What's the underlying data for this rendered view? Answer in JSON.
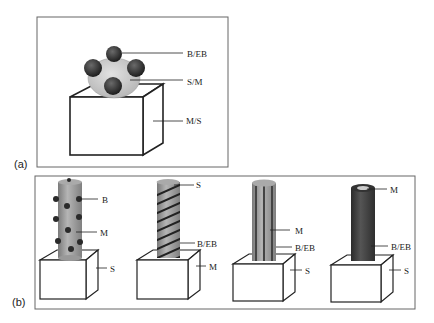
{
  "panel_a": {
    "label": "(a)",
    "callouts": {
      "top": "B/EB",
      "middle": "S/M",
      "bottom": "M/S"
    }
  },
  "panel_b": {
    "label": "(b)",
    "structures": [
      {
        "callouts": [
          "B",
          "M",
          "S"
        ]
      },
      {
        "callouts": [
          "S",
          "B/EB",
          "M"
        ]
      },
      {
        "callouts": [
          "M",
          "B/EB",
          "S"
        ]
      },
      {
        "callouts": [
          "M",
          "B/EB",
          "S"
        ]
      }
    ]
  },
  "colors": {
    "ball": "#3a3a3a",
    "shell": "#cfcfcf",
    "rod": "#9a9a9a",
    "dark_rod": "#4a4a4a",
    "stroke": "#222222"
  }
}
